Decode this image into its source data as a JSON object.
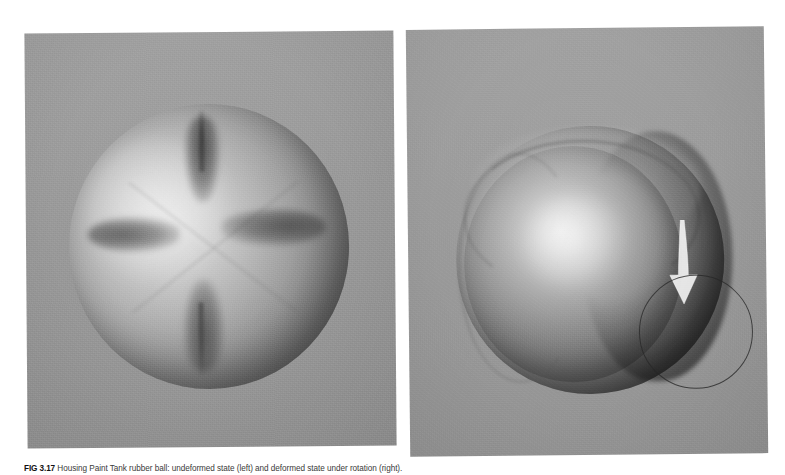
{
  "figure": {
    "caption_label": "FIG 3.17",
    "caption_text": "Housing Paint Tank rubber ball: undeformed state (left) and deformed state under rotation (right).",
    "panels": [
      {
        "id": "left",
        "name": "undeformed-sphere-panel",
        "title": "Undeformed spherical ball with cross-shaped surface grooves",
        "background_color": "#9b9b9b",
        "features": [
          "top-groove",
          "left-groove",
          "right-groove",
          "bottom-groove",
          "diagonal-seam-cross",
          "specular-highlight"
        ]
      },
      {
        "id": "right",
        "name": "deformed-sphere-panel",
        "title": "Deformed ball showing outer bulging band, rotation arrow and contact circle",
        "background_color": "#9b9b9b",
        "features": [
          "outer-bulge-band",
          "inner-ball",
          "band-crease",
          "rotation-arrow",
          "annotation-circle",
          "specular-highlight"
        ]
      }
    ]
  },
  "colors": {
    "page_background": "#ffffff",
    "panel_gray": "#9b9b9b",
    "sphere_highlight": "#e2e2e2",
    "sphere_shadow": "#3c3c3c",
    "arrow_fill": "#f2f2f2",
    "annotation_stroke": "#262626",
    "caption_label_color": "#111111",
    "caption_text_color": "#3a3a3a"
  },
  "annotations": {
    "arrow_direction": "down",
    "arrow_label": "rotation-direction-arrow",
    "circle_label": "contact-region-circle"
  }
}
